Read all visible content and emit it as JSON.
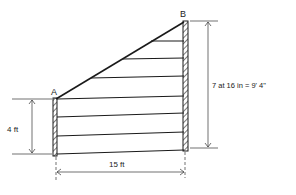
{
  "diagram": {
    "type": "fence/wall elevation with horizontal boards",
    "points": {
      "a_label": "A",
      "b_label": "B"
    },
    "dimensions": {
      "left_height": "4 ft",
      "right_height": "7 at 16 in = 9' 4\"",
      "base_length": "15 ft"
    },
    "board_count_right": 7,
    "colors": {
      "line": "#1a1a1a",
      "background": "#ffffff"
    }
  }
}
